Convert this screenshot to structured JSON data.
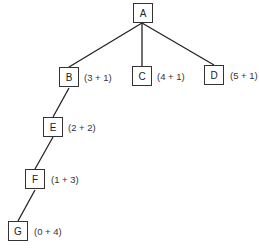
{
  "diagram": {
    "type": "tree",
    "nodes": [
      {
        "id": "A",
        "label": "A",
        "annotation": ""
      },
      {
        "id": "B",
        "label": "B",
        "annotation": "(3 + 1)"
      },
      {
        "id": "C",
        "label": "C",
        "annotation": "(4 + 1)"
      },
      {
        "id": "D",
        "label": "D",
        "annotation": "(5 + 1)"
      },
      {
        "id": "E",
        "label": "E",
        "annotation": "(2 + 2)"
      },
      {
        "id": "F",
        "label": "F",
        "annotation": "(1 + 3)"
      },
      {
        "id": "G",
        "label": "G",
        "annotation": "(0 + 4)"
      }
    ],
    "edges": [
      [
        "A",
        "B"
      ],
      [
        "A",
        "C"
      ],
      [
        "A",
        "D"
      ],
      [
        "B",
        "E"
      ],
      [
        "E",
        "F"
      ],
      [
        "F",
        "G"
      ]
    ]
  }
}
